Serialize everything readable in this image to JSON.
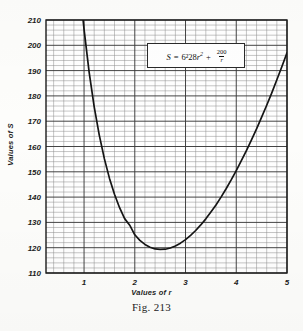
{
  "figure": {
    "caption": "Fig. 213",
    "xlabel": "Values of r",
    "ylabel": "Values of S",
    "equation_text": "S = 6·28r² + 200/r",
    "equation": {
      "lhs": "S",
      "equals": "=",
      "coefficient": "6²28",
      "var": "r",
      "exponent": "2",
      "plus": "+",
      "numerator": "200",
      "denominator": "r"
    }
  },
  "chart_data": {
    "type": "line",
    "title": "",
    "xlabel": "Values of r",
    "ylabel": "Values of S",
    "equation": "S = 6.28*r^2 + 200/r",
    "xlim": [
      0.25,
      5.0
    ],
    "ylim": [
      110,
      210
    ],
    "xticks": [
      1,
      2,
      3,
      4,
      5
    ],
    "yticks": [
      110,
      120,
      130,
      140,
      150,
      160,
      170,
      180,
      190,
      200,
      210
    ],
    "grid": "major-and-minor",
    "minor_divisions_per_major": 5,
    "legend": "none",
    "minimum": {
      "r": 2.55,
      "S": 118.2
    },
    "x": [
      0.95,
      1.0,
      1.1,
      1.2,
      1.3,
      1.4,
      1.5,
      1.6,
      1.7,
      1.8,
      1.9,
      2.0,
      2.1,
      2.2,
      2.3,
      2.4,
      2.5,
      2.6,
      2.7,
      2.8,
      2.9,
      3.0,
      3.1,
      3.2,
      3.3,
      3.4,
      3.5,
      3.6,
      3.7,
      3.8,
      3.9,
      4.0,
      4.1,
      4.2,
      4.3,
      4.4,
      4.5,
      4.6,
      4.7,
      4.8,
      4.9,
      5.0
    ],
    "y": [
      216.2,
      206.3,
      189.4,
      175.7,
      164.5,
      155.2,
      147.5,
      141.1,
      135.8,
      131.5,
      128.9,
      125.1,
      122.9,
      121.3,
      120.2,
      119.5,
      119.3,
      119.4,
      119.9,
      120.7,
      121.8,
      123.2,
      124.9,
      126.8,
      129.0,
      131.4,
      134.1,
      136.9,
      140.0,
      143.3,
      146.8,
      150.5,
      154.4,
      158.4,
      162.6,
      167.0,
      171.6,
      176.3,
      181.2,
      186.4,
      191.6,
      197.0
    ]
  },
  "yticks_labels": [
    "210",
    "200",
    "190",
    "180",
    "170",
    "160",
    "150",
    "140",
    "130",
    "120",
    "110"
  ],
  "xticks_labels": [
    "1",
    "2",
    "3",
    "4",
    "5"
  ],
  "colors": {
    "curve": "#151515",
    "frame": "#1b1b1b",
    "grid_major": "#3a3a3a",
    "grid_minor": "#8c8c8c",
    "paper": "#fdfdfb",
    "text": "#1d1d1d"
  }
}
